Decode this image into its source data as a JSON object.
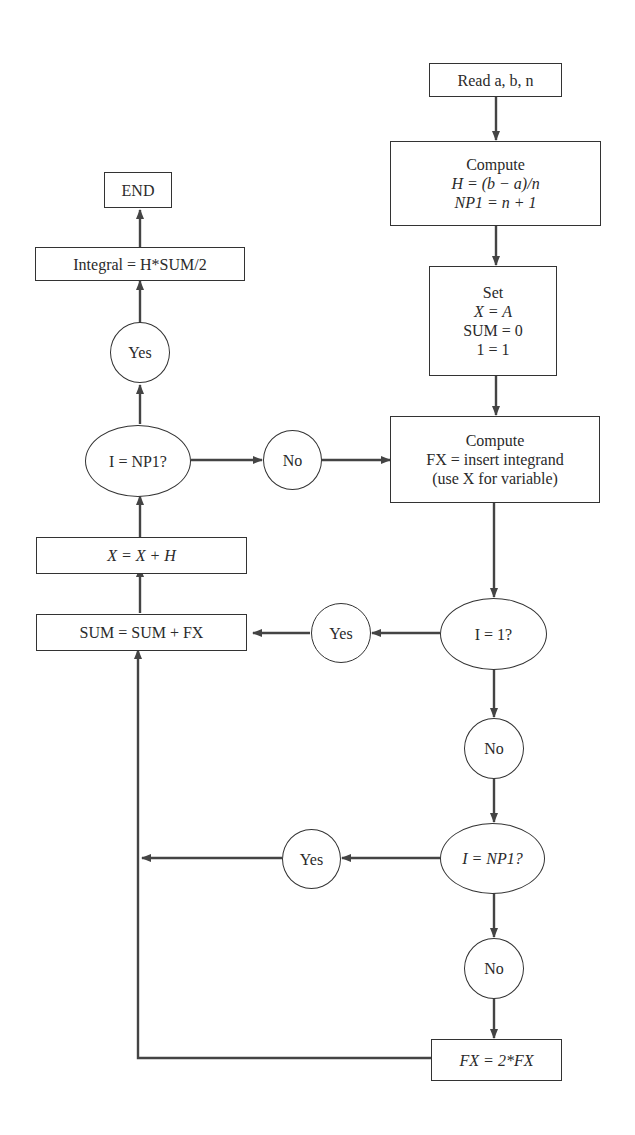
{
  "diagram": {
    "type": "flowchart",
    "colors": {
      "stroke": "#333333",
      "text": "#2a2a2a",
      "background": "#ffffff"
    },
    "nodes": {
      "read": {
        "shape": "box",
        "lines": [
          "Read a, b, n"
        ]
      },
      "compute_h": {
        "shape": "box",
        "lines": [
          "Compute",
          "H = (b − a)/n",
          "NP1 = n + 1"
        ]
      },
      "set": {
        "shape": "box",
        "lines": [
          "Set",
          "X = A",
          "SUM = 0",
          "1 = 1"
        ]
      },
      "compute_fx": {
        "shape": "box",
        "lines": [
          "Compute",
          "FX = insert integrand",
          "(use X for variable)"
        ]
      },
      "dec_i1": {
        "shape": "ellipse",
        "lines": [
          "I = 1?"
        ]
      },
      "yes_i1": {
        "shape": "circle",
        "lines": [
          "Yes"
        ]
      },
      "no_i1": {
        "shape": "circle",
        "lines": [
          "No"
        ]
      },
      "dec_inp1_right": {
        "shape": "ellipse",
        "lines": [
          "I = NP1?"
        ]
      },
      "yes_inp1_right": {
        "shape": "circle",
        "lines": [
          "Yes"
        ]
      },
      "no_inp1_right": {
        "shape": "circle",
        "lines": [
          "No"
        ]
      },
      "double_fx": {
        "shape": "box",
        "lines": [
          "FX = 2*FX"
        ]
      },
      "sum": {
        "shape": "box",
        "lines": [
          "SUM = SUM + FX"
        ]
      },
      "x_inc": {
        "shape": "box",
        "lines": [
          "X = X + H"
        ]
      },
      "dec_inp1_left": {
        "shape": "ellipse",
        "lines": [
          "I = NP1?"
        ]
      },
      "no_left": {
        "shape": "circle",
        "lines": [
          "No"
        ]
      },
      "yes_left": {
        "shape": "circle",
        "lines": [
          "Yes"
        ]
      },
      "integral": {
        "shape": "box",
        "lines": [
          "Integral = H*SUM/2"
        ]
      },
      "end": {
        "shape": "box",
        "lines": [
          "END"
        ]
      }
    },
    "edges": [
      {
        "from": "read",
        "to": "compute_h"
      },
      {
        "from": "compute_h",
        "to": "set"
      },
      {
        "from": "set",
        "to": "compute_fx"
      },
      {
        "from": "compute_fx",
        "to": "dec_i1"
      },
      {
        "from": "dec_i1",
        "to": "yes_i1",
        "label": "Yes"
      },
      {
        "from": "yes_i1",
        "to": "sum"
      },
      {
        "from": "dec_i1",
        "to": "no_i1",
        "label": "No"
      },
      {
        "from": "no_i1",
        "to": "dec_inp1_right"
      },
      {
        "from": "dec_inp1_right",
        "to": "yes_inp1_right",
        "label": "Yes"
      },
      {
        "from": "yes_inp1_right",
        "to": "sum"
      },
      {
        "from": "dec_inp1_right",
        "to": "no_inp1_right",
        "label": "No"
      },
      {
        "from": "no_inp1_right",
        "to": "double_fx"
      },
      {
        "from": "double_fx",
        "to": "sum"
      },
      {
        "from": "sum",
        "to": "x_inc"
      },
      {
        "from": "x_inc",
        "to": "dec_inp1_left"
      },
      {
        "from": "dec_inp1_left",
        "to": "no_left",
        "label": "No"
      },
      {
        "from": "no_left",
        "to": "compute_fx"
      },
      {
        "from": "dec_inp1_left",
        "to": "yes_left",
        "label": "Yes"
      },
      {
        "from": "yes_left",
        "to": "integral"
      },
      {
        "from": "integral",
        "to": "end"
      }
    ]
  }
}
